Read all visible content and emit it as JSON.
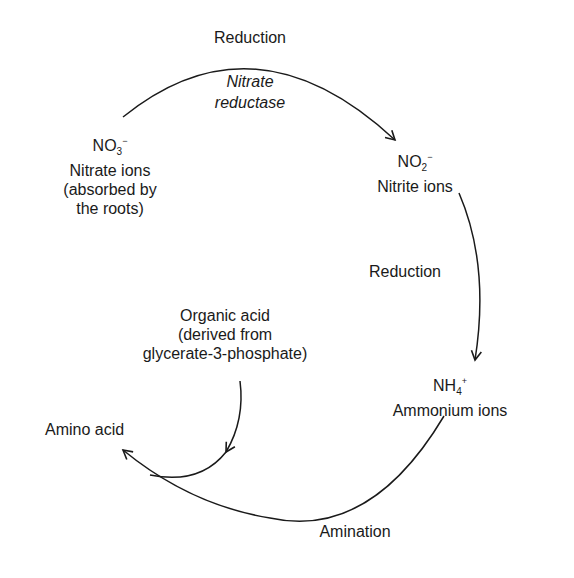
{
  "diagram": {
    "nodes": {
      "nitrate": {
        "formula_base": "NO",
        "formula_sub": "3",
        "formula_sup": "−",
        "line1": "Nitrate ions",
        "line2": "(absorbed by",
        "line3": "the roots)"
      },
      "nitrite": {
        "formula_base": "NO",
        "formula_sub": "2",
        "formula_sup": "−",
        "line1": "Nitrite ions"
      },
      "ammonium": {
        "formula_base": "NH",
        "formula_sub": "4",
        "formula_sup": "+",
        "line1": "Ammonium ions"
      },
      "organic_acid": {
        "line1": "Organic acid",
        "line2": "(derived from",
        "line3": "glycerate-3-phosphate)"
      },
      "amino_acid": {
        "line1": "Amino acid"
      }
    },
    "edges": {
      "nitrate_to_nitrite": {
        "label": "Reduction",
        "enzyme_line1": "Nitrate",
        "enzyme_line2": "reductase"
      },
      "nitrite_to_ammonium": {
        "label": "Reduction"
      },
      "ammonium_to_amino_acid": {
        "label": "Amination"
      }
    },
    "colors": {
      "ink": "#1a1a1a",
      "background": "#ffffff"
    }
  }
}
